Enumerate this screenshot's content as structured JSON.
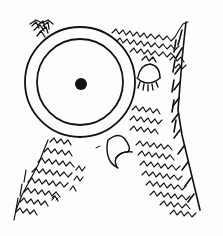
{
  "illustration": {
    "subject": "owl wearing a monocle",
    "style": "black ink line drawing with hatched feathers",
    "colors": {
      "ink": "#111111",
      "paper": "#fdfdfd"
    },
    "monocle": {
      "cx": 80,
      "cy": 82,
      "outer_r": 55,
      "inner_r": 43,
      "pupil": {
        "cx": 81,
        "cy": 84,
        "r": 6
      }
    },
    "closed_eye": {
      "cx": 148,
      "cy": 76
    },
    "beak": {
      "x": 118,
      "y": 150
    }
  }
}
